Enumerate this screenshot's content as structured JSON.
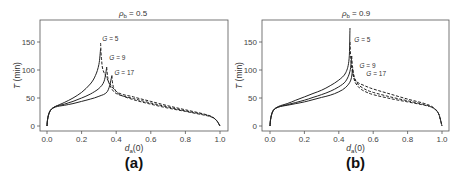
{
  "chart_data": [
    {
      "type": "line",
      "panel_label": "(a)",
      "title": "ρ_b = 0.5",
      "title_main": "ρ",
      "title_sub": "b",
      "title_rest": " = 0.5",
      "xlabel": "d_a(0)",
      "xlabel_main": "d",
      "xlabel_sub": "a",
      "xlabel_rest": "(0)",
      "ylabel": "T (min)",
      "ylabel_italic": "T",
      "ylabel_rest": " (min)",
      "xlim": [
        0.0,
        1.0
      ],
      "ylim": [
        0,
        180
      ],
      "xticks": [
        "0.0",
        "0.2",
        "0.4",
        "0.6",
        "0.8",
        "1.0"
      ],
      "yticks": [
        "0",
        "50",
        "100",
        "150"
      ],
      "grid": false,
      "annotations": [
        "G = 5",
        "G = 9",
        "G = 17"
      ],
      "series": [
        {
          "name": "G = 5 (solid)",
          "style": "solid",
          "x": [
            0.0,
            0.005,
            0.02,
            0.05,
            0.1,
            0.15,
            0.2,
            0.25,
            0.28,
            0.3,
            0.31
          ],
          "y": [
            0,
            15,
            28,
            35,
            42,
            50,
            60,
            75,
            90,
            110,
            138
          ]
        },
        {
          "name": "G = 9 (solid)",
          "style": "solid",
          "x": [
            0.0,
            0.005,
            0.02,
            0.05,
            0.1,
            0.15,
            0.2,
            0.25,
            0.3,
            0.33,
            0.345
          ],
          "y": [
            0,
            15,
            28,
            35,
            39,
            44,
            50,
            57,
            67,
            80,
            105
          ]
        },
        {
          "name": "G = 17 (solid)",
          "style": "solid",
          "x": [
            0.0,
            0.005,
            0.02,
            0.05,
            0.1,
            0.15,
            0.2,
            0.25,
            0.3,
            0.35,
            0.375
          ],
          "y": [
            0,
            15,
            28,
            34,
            37,
            40,
            44,
            48,
            53,
            62,
            90
          ]
        },
        {
          "name": "G = 5 (dashed)",
          "style": "dashed",
          "x": [
            0.31,
            0.315,
            0.33,
            0.4,
            0.5,
            0.6,
            0.7,
            0.8,
            0.9,
            0.95,
            0.98,
            1.0
          ],
          "y": [
            148,
            120,
            95,
            62,
            52,
            44,
            36,
            29,
            22,
            17,
            10,
            0
          ]
        },
        {
          "name": "G = 9 (dashed)",
          "style": "dashed",
          "x": [
            0.345,
            0.35,
            0.36,
            0.4,
            0.5,
            0.6,
            0.7,
            0.8,
            0.9,
            0.95,
            0.98,
            1.0
          ],
          "y": [
            105,
            90,
            75,
            58,
            49,
            41,
            34,
            27,
            21,
            17,
            10,
            0
          ]
        },
        {
          "name": "G = 17 (dashed)",
          "style": "dashed",
          "x": [
            0.375,
            0.38,
            0.39,
            0.42,
            0.5,
            0.6,
            0.7,
            0.8,
            0.9,
            0.95,
            0.98,
            1.0
          ],
          "y": [
            90,
            75,
            66,
            56,
            47,
            39,
            32,
            26,
            20,
            16,
            10,
            0
          ]
        }
      ]
    },
    {
      "type": "line",
      "panel_label": "(b)",
      "title": "ρ_b = 0.9",
      "title_main": "ρ",
      "title_sub": "b",
      "title_rest": " = 0.9",
      "xlabel": "d_a(0)",
      "xlabel_main": "d",
      "xlabel_sub": "a",
      "xlabel_rest": "(0)",
      "ylabel": "T (min)",
      "ylabel_italic": "T",
      "ylabel_rest": " (min)",
      "xlim": [
        0.0,
        1.0
      ],
      "ylim": [
        0,
        180
      ],
      "xticks": [
        "0.0",
        "0.2",
        "0.4",
        "0.6",
        "0.8",
        "1.0"
      ],
      "yticks": [
        "0",
        "50",
        "100",
        "150"
      ],
      "grid": false,
      "annotations": [
        "G = 5",
        "G = 9",
        "G = 17"
      ],
      "series": [
        {
          "name": "G = 5 (solid)",
          "style": "solid",
          "x": [
            0.0,
            0.005,
            0.02,
            0.05,
            0.1,
            0.15,
            0.2,
            0.25,
            0.3,
            0.35,
            0.4,
            0.44,
            0.46,
            0.465
          ],
          "y": [
            0,
            15,
            28,
            35,
            40,
            46,
            52,
            58,
            64,
            72,
            82,
            95,
            120,
            175
          ]
        },
        {
          "name": "G = 9 (solid)",
          "style": "solid",
          "x": [
            0.0,
            0.005,
            0.02,
            0.05,
            0.1,
            0.15,
            0.2,
            0.25,
            0.3,
            0.35,
            0.4,
            0.44,
            0.465,
            0.475
          ],
          "y": [
            0,
            15,
            28,
            34,
            38,
            42,
            46,
            51,
            56,
            62,
            70,
            80,
            98,
            125
          ]
        },
        {
          "name": "G = 17 (solid)",
          "style": "solid",
          "x": [
            0.0,
            0.005,
            0.02,
            0.05,
            0.1,
            0.15,
            0.2,
            0.25,
            0.3,
            0.35,
            0.4,
            0.44,
            0.47,
            0.48
          ],
          "y": [
            0,
            15,
            28,
            34,
            37,
            40,
            43,
            47,
            51,
            55,
            61,
            69,
            82,
            102
          ]
        },
        {
          "name": "G = 5 (dashed)",
          "style": "dashed",
          "x": [
            0.465,
            0.47,
            0.48,
            0.5,
            0.55,
            0.6,
            0.7,
            0.8,
            0.9,
            0.95,
            0.98,
            1.0
          ],
          "y": [
            150,
            120,
            95,
            80,
            72,
            66,
            57,
            48,
            40,
            33,
            22,
            0
          ]
        },
        {
          "name": "G = 9 (dashed)",
          "style": "dashed",
          "x": [
            0.475,
            0.48,
            0.49,
            0.51,
            0.55,
            0.6,
            0.7,
            0.8,
            0.9,
            0.95,
            0.98,
            1.0
          ],
          "y": [
            125,
            105,
            88,
            75,
            66,
            60,
            52,
            45,
            38,
            32,
            22,
            0
          ]
        },
        {
          "name": "G = 17 (dashed)",
          "style": "dashed",
          "x": [
            0.48,
            0.485,
            0.495,
            0.52,
            0.55,
            0.6,
            0.7,
            0.8,
            0.9,
            0.95,
            0.98,
            1.0
          ],
          "y": [
            102,
            90,
            78,
            68,
            62,
            56,
            49,
            43,
            37,
            32,
            22,
            0
          ]
        }
      ]
    }
  ],
  "layout": {
    "panels": [
      {
        "frame": [
          40,
          20,
          228,
          131
        ],
        "x0px": 47,
        "x1px": 220,
        "y0px": 126,
        "y150px": 42,
        "title_x": 133,
        "ann": [
          {
            "x": 0.32,
            "y": 152
          },
          {
            "x": 0.36,
            "y": 117
          },
          {
            "x": 0.39,
            "y": 91
          }
        ]
      },
      {
        "frame": [
          262,
          20,
          449,
          131
        ],
        "x0px": 270,
        "x1px": 442,
        "y0px": 126,
        "y150px": 42,
        "title_x": 356,
        "ann": [
          {
            "x": 0.49,
            "y": 150
          },
          {
            "x": 0.52,
            "y": 103
          },
          {
            "x": 0.56,
            "y": 90
          }
        ]
      }
    ]
  }
}
